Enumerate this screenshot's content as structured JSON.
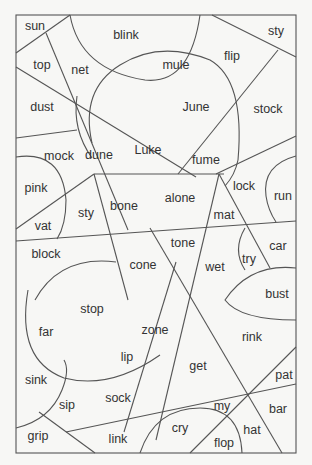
{
  "puzzle": {
    "words": [
      {
        "id": "sun",
        "text": "sun",
        "x": 35,
        "y": 26
      },
      {
        "id": "blink",
        "text": "blink",
        "x": 126,
        "y": 35
      },
      {
        "id": "sty-top",
        "text": "sty",
        "x": 276,
        "y": 31
      },
      {
        "id": "top",
        "text": "top",
        "x": 42,
        "y": 65
      },
      {
        "id": "net",
        "text": "net",
        "x": 80,
        "y": 70
      },
      {
        "id": "mule",
        "text": "mule",
        "x": 176,
        "y": 65
      },
      {
        "id": "flip",
        "text": "flip",
        "x": 232,
        "y": 56
      },
      {
        "id": "dust",
        "text": "dust",
        "x": 42,
        "y": 107
      },
      {
        "id": "june",
        "text": "June",
        "x": 196,
        "y": 107
      },
      {
        "id": "stock",
        "text": "stock",
        "x": 268,
        "y": 109
      },
      {
        "id": "mock",
        "text": "mock",
        "x": 59,
        "y": 156
      },
      {
        "id": "dune",
        "text": "dune",
        "x": 99,
        "y": 155
      },
      {
        "id": "luke",
        "text": "Luke",
        "x": 148,
        "y": 150
      },
      {
        "id": "fume",
        "text": "fume",
        "x": 206,
        "y": 160
      },
      {
        "id": "pink",
        "text": "pink",
        "x": 36,
        "y": 188
      },
      {
        "id": "lock",
        "text": "lock",
        "x": 244,
        "y": 186
      },
      {
        "id": "run",
        "text": "run",
        "x": 283,
        "y": 196
      },
      {
        "id": "alone",
        "text": "alone",
        "x": 180,
        "y": 198
      },
      {
        "id": "bone",
        "text": "bone",
        "x": 124,
        "y": 206
      },
      {
        "id": "sty",
        "text": "sty",
        "x": 86,
        "y": 213
      },
      {
        "id": "vat",
        "text": "vat",
        "x": 43,
        "y": 226
      },
      {
        "id": "mat",
        "text": "mat",
        "x": 224,
        "y": 215
      },
      {
        "id": "block",
        "text": "block",
        "x": 46,
        "y": 254
      },
      {
        "id": "tone",
        "text": "tone",
        "x": 183,
        "y": 243
      },
      {
        "id": "car",
        "text": "car",
        "x": 278,
        "y": 246
      },
      {
        "id": "cone",
        "text": "cone",
        "x": 143,
        "y": 265
      },
      {
        "id": "try",
        "text": "try",
        "x": 249,
        "y": 259
      },
      {
        "id": "wet",
        "text": "wet",
        "x": 215,
        "y": 267
      },
      {
        "id": "bust",
        "text": "bust",
        "x": 277,
        "y": 294
      },
      {
        "id": "stop",
        "text": "stop",
        "x": 92,
        "y": 309
      },
      {
        "id": "far",
        "text": "far",
        "x": 46,
        "y": 332
      },
      {
        "id": "zone",
        "text": "zone",
        "x": 155,
        "y": 330
      },
      {
        "id": "rink",
        "text": "rink",
        "x": 252,
        "y": 337
      },
      {
        "id": "lip",
        "text": "lip",
        "x": 127,
        "y": 357
      },
      {
        "id": "get",
        "text": "get",
        "x": 198,
        "y": 366
      },
      {
        "id": "sink",
        "text": "sink",
        "x": 36,
        "y": 380
      },
      {
        "id": "pat",
        "text": "pat",
        "x": 284,
        "y": 375
      },
      {
        "id": "sip",
        "text": "sip",
        "x": 67,
        "y": 405
      },
      {
        "id": "sock",
        "text": "sock",
        "x": 118,
        "y": 398
      },
      {
        "id": "my",
        "text": "my",
        "x": 222,
        "y": 406
      },
      {
        "id": "bar",
        "text": "bar",
        "x": 278,
        "y": 409
      },
      {
        "id": "cry",
        "text": "cry",
        "x": 180,
        "y": 428
      },
      {
        "id": "hat",
        "text": "hat",
        "x": 252,
        "y": 430
      },
      {
        "id": "grip",
        "text": "grip",
        "x": 38,
        "y": 436
      },
      {
        "id": "link",
        "text": "link",
        "x": 118,
        "y": 439
      },
      {
        "id": "flop",
        "text": "flop",
        "x": 224,
        "y": 443
      }
    ]
  }
}
